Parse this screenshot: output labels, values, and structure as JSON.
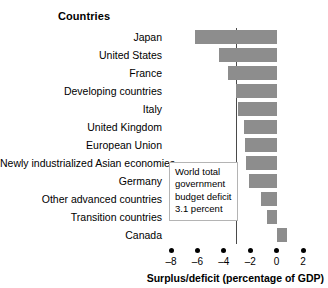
{
  "chart_data": {
    "type": "bar",
    "orientation": "horizontal",
    "title": "",
    "column_header": "Countries",
    "xlabel": "Surplus/deficit (percentage of GDP)",
    "ylabel": "",
    "xlim": [
      -8,
      2
    ],
    "xticks": [
      -8,
      -6,
      -4,
      -2,
      0,
      2
    ],
    "xtick_labels": [
      "–8",
      "–6",
      "–4",
      "–2",
      "0",
      "2"
    ],
    "grid": false,
    "legend": "none",
    "bar_color": "#8d8d8d",
    "reference_line": {
      "value": -3.1,
      "label": "World total government budget deficit 3.1 percent",
      "color": "#4a4a4a"
    },
    "annotation": {
      "lines": [
        "World total",
        "government",
        "budget deficit",
        "3.1 percent"
      ]
    },
    "categories": [
      "Japan",
      "United States",
      "France",
      "Developing countries",
      "Italy",
      "United Kingdom",
      "European Union",
      "Newly industrialized Asian economies",
      "Germany",
      "Other advanced countries",
      "Transition countries",
      "Canada"
    ],
    "values": [
      -6.2,
      -4.4,
      -3.7,
      -3.1,
      -2.9,
      -2.5,
      -2.4,
      -2.3,
      -2.1,
      -1.2,
      -0.7,
      0.8
    ]
  }
}
